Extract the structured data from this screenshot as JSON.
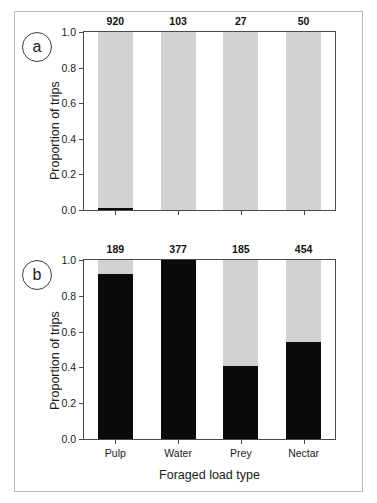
{
  "figure": {
    "axis_titles": {
      "y": "Proportion of trips",
      "x": "Foraged load type"
    },
    "y_ticks": [
      "0.0",
      "0.2",
      "0.4",
      "0.6",
      "0.8",
      "1.0"
    ],
    "categories": [
      "Pulp",
      "Water",
      "Prey",
      "Nectar"
    ],
    "colors": {
      "dark_segment": "#0a0a0a",
      "light_segment": "#d2d2d2",
      "axis": "#4a4a4a",
      "frame": "#b9b9b9"
    },
    "panels": [
      {
        "tag": "a",
        "sample_sizes": [
          "920",
          "103",
          "27",
          "50"
        ]
      },
      {
        "tag": "b",
        "sample_sizes": [
          "189",
          "377",
          "185",
          "454"
        ]
      }
    ]
  },
  "chart_data": [
    {
      "type": "bar",
      "panel": "a",
      "title": "",
      "xlabel": "Foraged load type",
      "ylabel": "Proportion of trips",
      "ylim": [
        0.0,
        1.0
      ],
      "ytick_values": [
        0.0,
        0.2,
        0.4,
        0.6,
        0.8,
        1.0
      ],
      "grid": false,
      "legend": "none",
      "stacked": true,
      "categories": [
        "Pulp",
        "Water",
        "Prey",
        "Nectar"
      ],
      "sample_sizes": [
        920,
        103,
        27,
        50
      ],
      "series": [
        {
          "name": "dark",
          "color": "#0a0a0a",
          "values": [
            0.01,
            0.0,
            0.0,
            0.0
          ]
        },
        {
          "name": "light",
          "color": "#d2d2d2",
          "values": [
            0.99,
            1.0,
            1.0,
            1.0
          ]
        }
      ],
      "annotations": [
        "920",
        "103",
        "27",
        "50"
      ]
    },
    {
      "type": "bar",
      "panel": "b",
      "title": "",
      "xlabel": "Foraged load type",
      "ylabel": "Proportion of trips",
      "ylim": [
        0.0,
        1.0
      ],
      "ytick_values": [
        0.0,
        0.2,
        0.4,
        0.6,
        0.8,
        1.0
      ],
      "grid": false,
      "legend": "none",
      "stacked": true,
      "categories": [
        "Pulp",
        "Water",
        "Prey",
        "Nectar"
      ],
      "sample_sizes": [
        189,
        377,
        185,
        454
      ],
      "series": [
        {
          "name": "dark",
          "color": "#0a0a0a",
          "values": [
            0.92,
            1.0,
            0.41,
            0.54
          ]
        },
        {
          "name": "light",
          "color": "#d2d2d2",
          "values": [
            0.08,
            0.0,
            0.59,
            0.46
          ]
        }
      ],
      "annotations": [
        "189",
        "377",
        "185",
        "454"
      ]
    }
  ]
}
